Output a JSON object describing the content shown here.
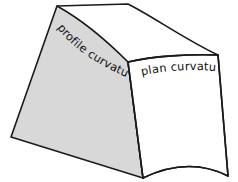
{
  "figure": {
    "background_color": "#ffffff",
    "outline_color": "#1a1a1a",
    "labels": {
      "profile": "profile curvature",
      "plan": "plan curvature"
    }
  },
  "faces": [
    {
      "id": "profile-face",
      "name": "profile-curvature-face",
      "fill_color": "#d8d8d8",
      "label": "profile curvature",
      "description": "left shaded face, concave upper boundary"
    },
    {
      "id": "plan-face",
      "name": "plan-curvature-face",
      "fill_color": "#ffffff",
      "label": "plan curvature",
      "description": "right white face, concave lower boundary"
    }
  ],
  "geometry": {
    "apex": "57,6",
    "top_ridge_right": "128,4",
    "bottom_left": "11,137",
    "bottom_ridge": "143,178",
    "bottom_right": "228,176",
    "right_top": "218,55",
    "ridge_top": "128,62",
    "profile_face_path": "M 57 6 L 11 137 L 143 178 L 128 62 C 112 46 86 22 57 6 Z",
    "plan_face_path": "M 128 62 C 152 56 190 54 218 55 L 228 176 C 200 162 170 165 143 178 Z",
    "back_top_edge": "M 57 6 L 128 4 C 152 16 186 40 218 55",
    "plan_top_curve": "M 128 62 C 152 56 190 54 218 55",
    "plan_bottom_curve": "M 143 178 C 170 165 200 162 228 176",
    "ridge_edge": "M 128 62 L 143 178",
    "right_edge": "M 218 55 L 228 176",
    "profile_label_path": "M 56 26 C 68 44 92 62 124 76",
    "plan_label_path": "M 140 76 C 165 70 196 69 214 71"
  }
}
